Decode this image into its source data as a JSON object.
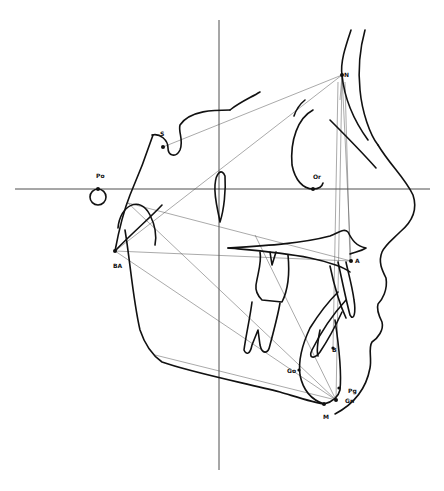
{
  "diagram": {
    "type": "cephalometric tracing",
    "landmarks": [
      {
        "id": "S",
        "label": "S",
        "x": 163,
        "y": 147
      },
      {
        "id": "N",
        "label": "N",
        "x": 342,
        "y": 75
      },
      {
        "id": "Po",
        "label": "Po",
        "x": 98,
        "y": 188
      },
      {
        "id": "Or",
        "label": "Or",
        "x": 313,
        "y": 189
      },
      {
        "id": "BA",
        "label": "BA",
        "x": 115,
        "y": 251
      },
      {
        "id": "A",
        "label": "A",
        "x": 351,
        "y": 261
      },
      {
        "id": "B",
        "label": "B",
        "x": 333,
        "y": 348
      },
      {
        "id": "Go",
        "label": "Go",
        "x": 299,
        "y": 370
      },
      {
        "id": "Pg",
        "label": "Pg",
        "x": 339,
        "y": 388
      },
      {
        "id": "Gn",
        "label": "Gn",
        "x": 336,
        "y": 400
      },
      {
        "id": "M",
        "label": "M",
        "x": 324,
        "y": 404
      }
    ],
    "labels": [
      {
        "text": "S",
        "x": 160,
        "y": 131
      },
      {
        "text": "N",
        "x": 344,
        "y": 104
      },
      {
        "text": "Po",
        "x": 96,
        "y": 173
      },
      {
        "text": "Or",
        "x": 313,
        "y": 174
      },
      {
        "text": "BA",
        "x": 113,
        "y": 263
      },
      {
        "text": "A",
        "x": 355,
        "y": 258
      },
      {
        "text": "B",
        "x": 332,
        "y": 347
      },
      {
        "text": "Go",
        "x": 287,
        "y": 368
      },
      {
        "text": "Pg",
        "x": 348,
        "y": 388
      },
      {
        "text": "Gn",
        "x": 345,
        "y": 398
      },
      {
        "text": "M",
        "x": 323,
        "y": 414
      }
    ],
    "reference_lines": {
      "frankfort_horizontal_y": 189,
      "vertical_x": 219
    }
  }
}
